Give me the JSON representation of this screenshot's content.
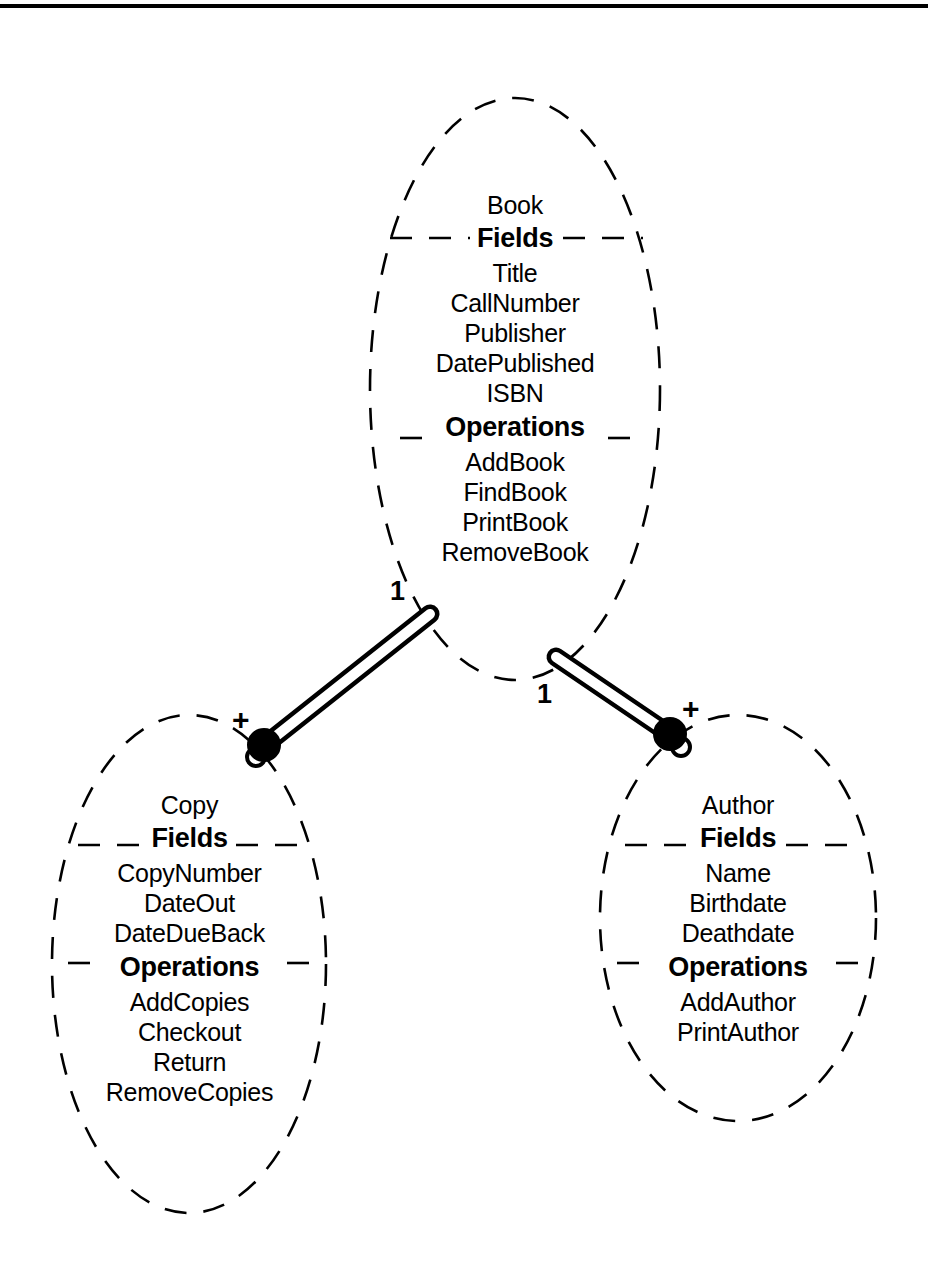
{
  "diagram": {
    "type": "object-model-class-diagram",
    "title_rule": "top-horizontal-rule",
    "background_color": "#ffffff",
    "line_color": "#000000",
    "classes": [
      {
        "id": "book",
        "name": "Book",
        "fields_header": "Fields",
        "fields": [
          "Title",
          "CallNumber",
          "Publisher",
          "DatePublished",
          "ISBN"
        ],
        "operations_header": "Operations",
        "operations": [
          "AddBook",
          "FindBook",
          "PrintBook",
          "RemoveBook"
        ]
      },
      {
        "id": "copy",
        "name": "Copy",
        "fields_header": "Fields",
        "fields": [
          "CopyNumber",
          "DateOut",
          "DateDueBack"
        ],
        "operations_header": "Operations",
        "operations": [
          "AddCopies",
          "Checkout",
          "Return",
          "RemoveCopies"
        ]
      },
      {
        "id": "author",
        "name": "Author",
        "fields_header": "Fields",
        "fields": [
          "Name",
          "Birthdate",
          "Deathdate"
        ],
        "operations_header": "Operations",
        "operations": [
          "AddAuthor",
          "PrintAuthor"
        ]
      }
    ],
    "relationships": [
      {
        "id": "book-copy",
        "from": "Book",
        "to": "Copy",
        "from_multiplicity": "1",
        "to_multiplicity": "+"
      },
      {
        "id": "book-author",
        "from": "Book",
        "to": "Author",
        "from_multiplicity": "1",
        "to_multiplicity": "+"
      }
    ]
  }
}
